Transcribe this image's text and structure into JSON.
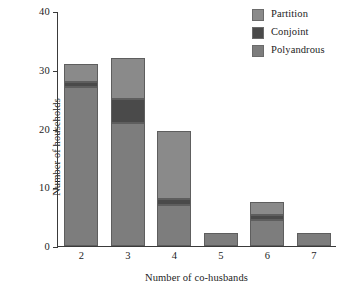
{
  "chart_data": {
    "type": "bar",
    "subtype": "stacked-bar",
    "title": "",
    "xlabel": "Number of co-husbands",
    "ylabel": "Number of households",
    "categories": [
      "2",
      "3",
      "4",
      "5",
      "6",
      "7"
    ],
    "ylim": [
      0,
      40
    ],
    "yticks": [
      0,
      10,
      20,
      30,
      40
    ],
    "ytick_labels": [
      "0",
      "10",
      "20",
      "30",
      "40"
    ],
    "grid": false,
    "legend_position": "top-right",
    "stack_order_bottom_to_top": [
      "Polyandrous",
      "Conjoint",
      "Partition"
    ],
    "series": [
      {
        "name": "Polyandrous",
        "color": "#7d7d7d",
        "values": [
          27,
          21,
          7,
          2.3,
          4.5,
          2.3
        ]
      },
      {
        "name": "Conjoint",
        "color": "#4a4a4a",
        "values": [
          1,
          4,
          1,
          0,
          0.7,
          0
        ]
      },
      {
        "name": "Partition",
        "color": "#8a8a8a",
        "values": [
          3,
          7,
          11.5,
          0,
          2.3,
          0
        ]
      }
    ],
    "totals": [
      31,
      32,
      19.5,
      2.3,
      7.5,
      2.3
    ]
  },
  "legend": {
    "items": [
      {
        "label": "Partition",
        "color": "#8a8a8a"
      },
      {
        "label": "Conjoint",
        "color": "#4a4a4a"
      },
      {
        "label": "Polyandrous",
        "color": "#7d7d7d"
      }
    ]
  },
  "axes": {
    "x_title": "Number of co-husbands",
    "y_title": "Number of households"
  }
}
